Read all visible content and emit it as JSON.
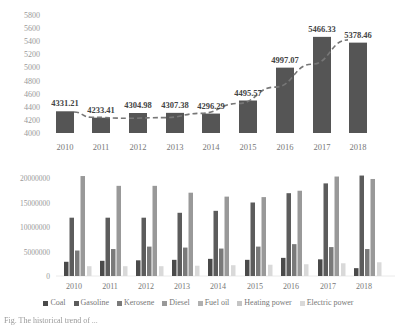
{
  "chart_data": [
    {
      "type": "bar",
      "title": "",
      "xlabel": "",
      "ylabel": "",
      "categories": [
        "2010",
        "2011",
        "2012",
        "2013",
        "2014",
        "2015",
        "2016",
        "2017",
        "2018"
      ],
      "values": [
        4331.21,
        4233.41,
        4304.98,
        4307.38,
        4296.29,
        4495.57,
        4997.07,
        5466.33,
        5378.46
      ],
      "data_labels": [
        "4331.21",
        "4233.41",
        "4304.98",
        "4307.38",
        "4296.29",
        "4495.57",
        "4997.07",
        "5466.33",
        "5378.46"
      ],
      "ylim": [
        4000,
        5800
      ],
      "yticks": [
        4000,
        4200,
        4400,
        4600,
        4800,
        5000,
        5200,
        5400,
        5600,
        5800
      ],
      "trendline": "dashed polynomial",
      "grid": false,
      "bar_color": "#555555"
    },
    {
      "type": "bar",
      "title": "",
      "xlabel": "",
      "ylabel": "",
      "categories": [
        "2010",
        "2011",
        "2012",
        "2013",
        "2014",
        "2015",
        "2016",
        "2017",
        "2018"
      ],
      "ylim": [
        0,
        20000000
      ],
      "yticks": [
        0,
        5000000,
        10000000,
        15000000,
        20000000
      ],
      "legend_position": "bottom",
      "grid": false,
      "series": [
        {
          "name": "Coal",
          "color": "#4a4a4a",
          "values": [
            2900000,
            3100000,
            3200000,
            3300000,
            3500000,
            3300000,
            3700000,
            3400000,
            1600000
          ]
        },
        {
          "name": "Gasoline",
          "color": "#5c5c5c",
          "values": [
            11900000,
            11900000,
            11900000,
            12900000,
            13300000,
            15000000,
            16900000,
            18900000,
            20500000
          ]
        },
        {
          "name": "Kerosene",
          "color": "#7a7a7a",
          "values": [
            5200000,
            5500000,
            6000000,
            5800000,
            5600000,
            6000000,
            6500000,
            5900000,
            5500000
          ]
        },
        {
          "name": "Diesel",
          "color": "#999999",
          "values": [
            20400000,
            18400000,
            18400000,
            17000000,
            16200000,
            16100000,
            17400000,
            20300000,
            19800000
          ]
        },
        {
          "name": "Fuel oil",
          "color": "#b0b0b0",
          "values": [
            0,
            0,
            0,
            0,
            0,
            0,
            0,
            0,
            0
          ]
        },
        {
          "name": "Heating power",
          "color": "#c4c4c4",
          "values": [
            0,
            0,
            0,
            0,
            0,
            0,
            0,
            0,
            0
          ]
        },
        {
          "name": "Electric power",
          "color": "#d9d9d9",
          "values": [
            2000000,
            2000000,
            2000000,
            2100000,
            2200000,
            2300000,
            2400000,
            2600000,
            2800000
          ]
        }
      ]
    }
  ],
  "legend": {
    "items": [
      {
        "label": "Coal",
        "color": "#4a4a4a"
      },
      {
        "label": "Gasoline",
        "color": "#5c5c5c"
      },
      {
        "label": "Kerosene",
        "color": "#7a7a7a"
      },
      {
        "label": "Diesel",
        "color": "#999999"
      },
      {
        "label": "Fuel oil",
        "color": "#b0b0b0"
      },
      {
        "label": "Heating power",
        "color": "#c4c4c4"
      },
      {
        "label": "Electric power",
        "color": "#d9d9d9"
      }
    ]
  },
  "caption": {
    "text": "Fig. The historical trend of ..."
  }
}
